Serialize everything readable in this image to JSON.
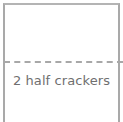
{
  "diagram": {
    "shape": "cracker-rectangle",
    "fold_line": "dashed",
    "caption": "2 half crackers"
  },
  "colors": {
    "border": "#a9a9a9",
    "dash": "#a8a8a8",
    "text": "#6f6f6f",
    "background": "#ffffff"
  }
}
